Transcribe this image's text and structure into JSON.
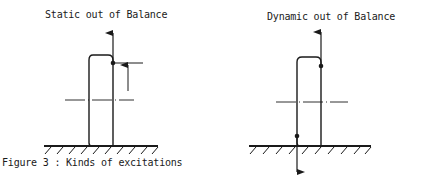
{
  "figure": {
    "caption": "Figure 3 : Kinds of excitations",
    "panels": [
      {
        "title": "Static out of Balance",
        "elements": [
          "wheel-profile",
          "upward-force-arrow",
          "imbalance-mass-dot",
          "offset-dimension-arrow",
          "axle-centerline",
          "ground-hatch"
        ]
      },
      {
        "title": "Dynamic out of Balance",
        "elements": [
          "wheel-profile",
          "upward-force-arrow",
          "downward-force-arrow",
          "top-imbalance-mass-dot",
          "bottom-imbalance-mass-dot",
          "axle-centerline",
          "ground-hatch"
        ]
      }
    ],
    "colors": {
      "ink": "#1a1a1a",
      "background": "#ffffff"
    }
  }
}
